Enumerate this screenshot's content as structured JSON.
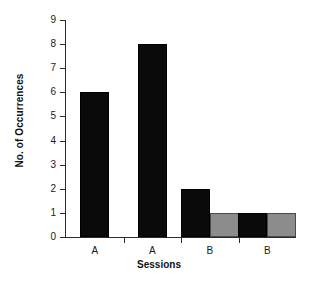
{
  "chart_data": {
    "type": "bar",
    "title": "",
    "xlabel": "Sessions",
    "ylabel": "No. of Occurrences",
    "categories": [
      "A",
      "A",
      "B",
      "B"
    ],
    "series": [
      {
        "name": "black",
        "color": "#0a0a0a",
        "values": [
          6,
          8,
          2,
          1
        ]
      },
      {
        "name": "gray",
        "color": "#8c8c8c",
        "values": [
          null,
          null,
          1,
          1
        ]
      }
    ],
    "ylim": [
      0,
      9
    ],
    "yticks": [
      0,
      1,
      2,
      3,
      4,
      5,
      6,
      7,
      8,
      9
    ],
    "ytick_labels": [
      "0",
      "1",
      "2",
      "3",
      "4",
      "5",
      "6",
      "7",
      "8",
      "9"
    ],
    "grid": false,
    "legend": "none"
  },
  "axes": {
    "y_title": "No. of Occurrences",
    "x_title": "Sessions"
  },
  "colors": {
    "black_bar": "#0a0a0a",
    "gray_bar": "#8c8c8c",
    "axis": "#2b2b2b",
    "background": "#ffffff"
  }
}
